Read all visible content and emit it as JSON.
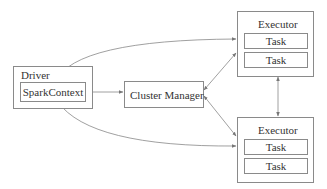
{
  "diagram": {
    "driver": {
      "label": "Driver",
      "context": "SparkContext"
    },
    "cluster_manager": {
      "label": "Cluster Manager"
    },
    "executors": [
      {
        "label": "Executor",
        "tasks": [
          "Task",
          "Task"
        ]
      },
      {
        "label": "Executor",
        "tasks": [
          "Task",
          "Task"
        ]
      }
    ],
    "edges": [
      {
        "from": "SparkContext",
        "to": "Cluster Manager",
        "direction": "both"
      },
      {
        "from": "SparkContext",
        "to": "Executor 1",
        "direction": "both",
        "shape": "curve"
      },
      {
        "from": "SparkContext",
        "to": "Executor 2",
        "direction": "both",
        "shape": "curve"
      },
      {
        "from": "Cluster Manager",
        "to": "Executor 1",
        "direction": "both"
      },
      {
        "from": "Cluster Manager",
        "to": "Executor 2",
        "direction": "both"
      },
      {
        "from": "Executor 1",
        "to": "Executor 2",
        "direction": "both"
      }
    ],
    "colors": {
      "stroke": "#8a8a8a",
      "text": "#333333",
      "background": "#ffffff"
    }
  }
}
